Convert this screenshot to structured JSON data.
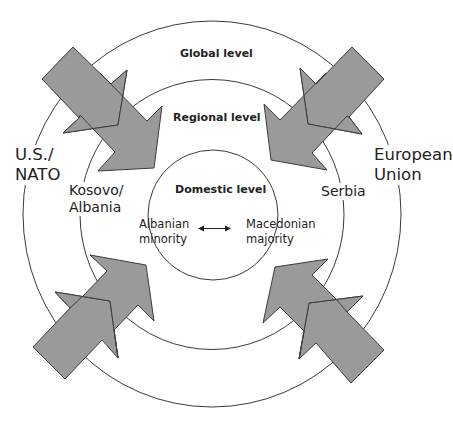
{
  "diagram": {
    "levels": {
      "global": "Global level",
      "regional": "Regional level",
      "domestic": "Domestic level"
    },
    "actors": {
      "global_left": [
        "U.S./",
        "NATO"
      ],
      "global_right": [
        "European",
        "Union"
      ],
      "regional_left": [
        "Kosovo/",
        "Albania"
      ],
      "regional_right": "Serbia",
      "domestic_left": [
        "Albanian",
        "minority"
      ],
      "domestic_right": [
        "Macedonian",
        "majority"
      ]
    },
    "relation_icon": "double-headed-arrow",
    "pressure_arrows": [
      {
        "position": "top-left",
        "direction": "inward"
      },
      {
        "position": "top-right",
        "direction": "inward"
      },
      {
        "position": "bottom-left",
        "direction": "inward"
      },
      {
        "position": "bottom-right",
        "direction": "inward"
      }
    ],
    "colors": {
      "arrow_fill": "#9a9a9a",
      "arrow_stroke": "#3c3c3c",
      "ring_stroke": "#3a3a3a",
      "background": "#ffffff"
    }
  }
}
